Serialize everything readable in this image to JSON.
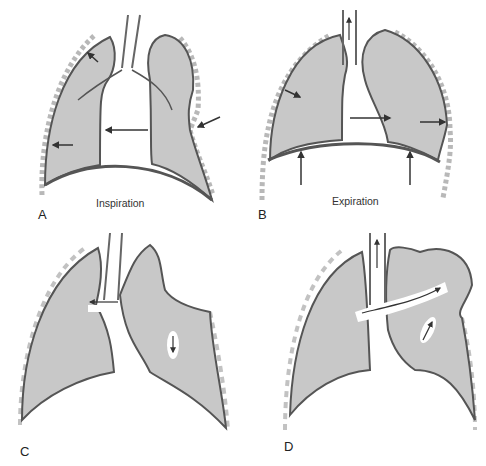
{
  "figure": {
    "panels": [
      {
        "id": "A",
        "label": "A",
        "caption": "Inspiration"
      },
      {
        "id": "B",
        "label": "B",
        "caption": "Expiration"
      },
      {
        "id": "C",
        "label": "C",
        "caption": ""
      },
      {
        "id": "D",
        "label": "D",
        "caption": ""
      }
    ],
    "colors": {
      "lung_fill": "#c8c8c8",
      "outline": "#555555",
      "background": "#ffffff",
      "arrow": "#333333",
      "rib": "#9a9a9a"
    }
  }
}
